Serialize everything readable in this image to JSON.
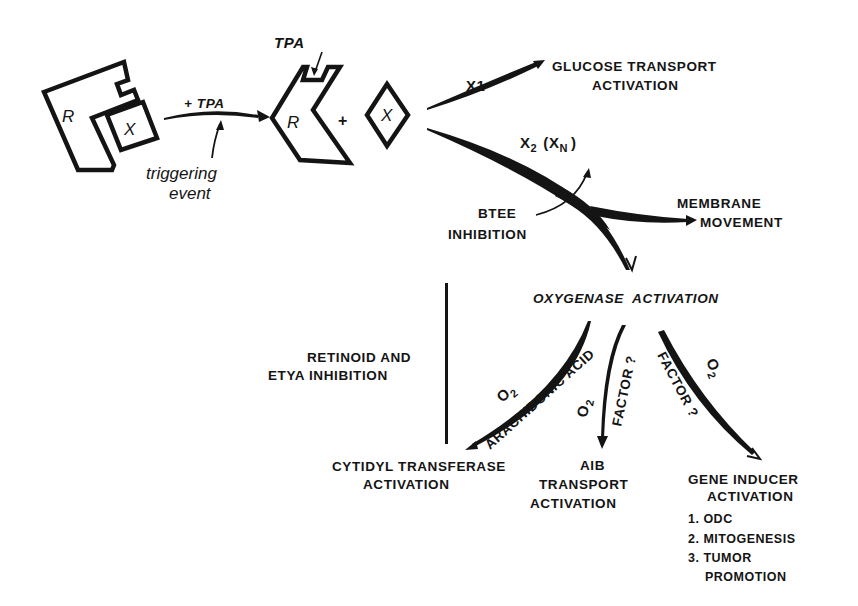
{
  "figure": {
    "type": "mechanism diagram",
    "stage1": {
      "receptor_label": "R",
      "bound_label": "X",
      "arrow_label": "+ TPA",
      "trigger_note_line1": "triggering",
      "trigger_note_line2": "event"
    },
    "stage2": {
      "tpa_label": "TPA",
      "receptor_label": "R",
      "plus": "+",
      "released_label": "X"
    },
    "branches": {
      "x1": {
        "label": "X1",
        "target_line1": "GLUCOSE TRANSPORT",
        "target_line2": "ACTIVATION"
      },
      "x2": {
        "label": "X2 (XN)",
        "label_main": "X",
        "label_sub": "2",
        "label_paren_open": "(X",
        "label_paren_sub": "N",
        "label_paren_close": ")",
        "membrane_line1": "MEMBRANE",
        "membrane_line2": "MOVEMENT",
        "inhibitor_line1": "BTEE",
        "inhibitor_line2": "INHIBITION"
      }
    },
    "oxygenase": {
      "title": "OXYGENASE  ACTIVATION",
      "inhibition_line1": "RETINOID AND",
      "inhibition_line2": "ETYA INHIBITION",
      "paths": [
        {
          "cofactor_main": "O",
          "cofactor_sub": "2",
          "along_label": "ARACHIDONIC ACID",
          "target_line1": "CYTIDYL TRANSFERASE",
          "target_line2": "ACTIVATION"
        },
        {
          "cofactor_main": "O",
          "cofactor_sub": "2",
          "along_label": "FACTOR ?",
          "target_line1": "AIB",
          "target_line2": "TRANSPORT",
          "target_line3": "ACTIVATION"
        },
        {
          "cofactor_main": "O",
          "cofactor_sub": "2",
          "along_label": "FACTOR ?",
          "target_line1": "GENE INDUCER",
          "target_line2": "ACTIVATION",
          "outcomes": [
            "1. ODC",
            "2. MITOGENESIS",
            "3. TUMOR",
            "PROMOTION"
          ]
        }
      ]
    }
  }
}
